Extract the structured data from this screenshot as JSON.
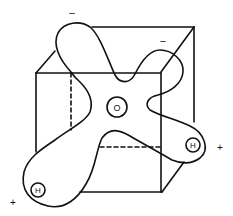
{
  "diagram": {
    "title": "",
    "atoms": [
      {
        "id": "oxygen",
        "label": "O"
      },
      {
        "id": "hydrogen-left",
        "label": "H"
      },
      {
        "id": "hydrogen-right",
        "label": "H"
      }
    ],
    "charges": [
      {
        "id": "lone-pair-top-left",
        "label": "–"
      },
      {
        "id": "lone-pair-top-right",
        "label": "–"
      },
      {
        "id": "hydrogen-right-charge",
        "label": "+"
      },
      {
        "id": "hydrogen-left-charge",
        "label": "+"
      }
    ],
    "colors": {
      "stroke": "#111111",
      "background": "#ffffff"
    }
  }
}
